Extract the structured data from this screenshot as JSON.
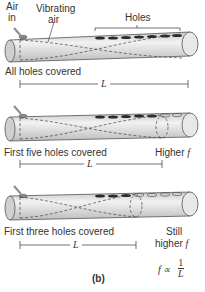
{
  "labels": {
    "air_in_1": "Air",
    "air_in_2": "in",
    "vibrating_1": "Vibrating",
    "vibrating_2": "air",
    "holes": "Holes",
    "all_covered": "All holes covered",
    "five_covered": "First five holes covered",
    "three_covered": "First three holes covered",
    "higher": "Higher",
    "still": "Still",
    "still_higher": "higher",
    "f": "f",
    "L": "L",
    "prop": "f ∝",
    "num": "1",
    "den": "L",
    "panel": "(b)"
  },
  "colors": {
    "tube": "#dcdcdc",
    "tube_edge": "#555555",
    "hole": "#2a2a2a",
    "arrow": "#8a8f96"
  }
}
